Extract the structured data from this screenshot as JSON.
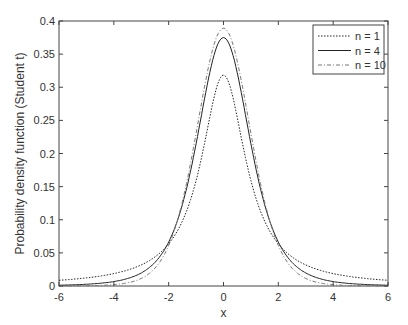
{
  "chart_data": {
    "type": "line",
    "title": "",
    "xlabel": "x",
    "ylabel": "Probability density function (Student t)",
    "xlim": [
      -6,
      6
    ],
    "ylim": [
      0,
      0.4
    ],
    "xticks": [
      -6,
      -4,
      -2,
      0,
      2,
      4,
      6
    ],
    "yticks": [
      0,
      0.05,
      0.1,
      0.15,
      0.2,
      0.25,
      0.3,
      0.35,
      0.4
    ],
    "grid": false,
    "legend_position": "upper right",
    "series": [
      {
        "name": "n = 1",
        "dof": 1,
        "style": "dotted",
        "peak": 0.318
      },
      {
        "name": "n = 4",
        "dof": 4,
        "style": "solid",
        "peak": 0.375
      },
      {
        "name": "n = 10",
        "dof": 10,
        "style": "dashdot",
        "peak": 0.389
      }
    ]
  }
}
